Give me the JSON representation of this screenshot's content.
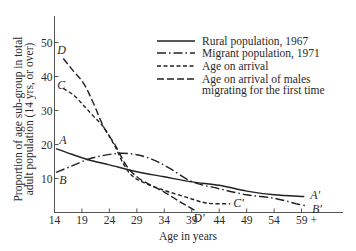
{
  "chart_data": {
    "type": "line",
    "title": "",
    "xlabel": "Age in years",
    "ylabel_lines": [
      "Proportion of age sub-group in total",
      "adult population (14 yrs, or over)"
    ],
    "x_ticks": [
      "14",
      "19",
      "24",
      "29",
      "34",
      "39",
      "44",
      "49",
      "54",
      "59 +"
    ],
    "x_tick_values": [
      14,
      19,
      24,
      29,
      34,
      39,
      44,
      49,
      54,
      59
    ],
    "y_ticks": [
      "10",
      "20",
      "30",
      "40",
      "50"
    ],
    "y_tick_values": [
      10,
      20,
      30,
      40,
      50
    ],
    "xlim": [
      14,
      66
    ],
    "ylim": [
      0,
      58
    ],
    "grid": false,
    "legend_position": "upper right",
    "series": [
      {
        "name": "Rural population, 1967",
        "style": "solid",
        "start_label": "A",
        "end_label": "A'",
        "points": [
          [
            14.3,
            18.8
          ],
          [
            17,
            17.2
          ],
          [
            20,
            15.6
          ],
          [
            24,
            14.0
          ],
          [
            29,
            12.0
          ],
          [
            34,
            10.5
          ],
          [
            39,
            9.0
          ],
          [
            44,
            8.0
          ],
          [
            49,
            6.3
          ],
          [
            54,
            5.2
          ],
          [
            59.5,
            4.7
          ]
        ]
      },
      {
        "name": "Migrant population, 1971",
        "style": "dashdot",
        "start_label": "B",
        "end_label": "B'",
        "points": [
          [
            14.3,
            11.8
          ],
          [
            17,
            13.6
          ],
          [
            20,
            15.6
          ],
          [
            23,
            16.8
          ],
          [
            26,
            17.4
          ],
          [
            29,
            17.0
          ],
          [
            32,
            15.5
          ],
          [
            35,
            13.0
          ],
          [
            39,
            9.1
          ],
          [
            44,
            7.0
          ],
          [
            49,
            5.2
          ],
          [
            54,
            4.2
          ],
          [
            58,
            2.6
          ],
          [
            59.8,
            2.0
          ]
        ]
      },
      {
        "name": "Age on arrival",
        "style": "dashed-short",
        "start_label": "C",
        "end_label": "C'",
        "points": [
          [
            15.6,
            36.5
          ],
          [
            17.5,
            34.5
          ],
          [
            19.3,
            31.5
          ],
          [
            21,
            28.5
          ],
          [
            23,
            25.0
          ],
          [
            25,
            19.5
          ],
          [
            26.5,
            14.5
          ],
          [
            28,
            11.0
          ],
          [
            30,
            9.0
          ],
          [
            34,
            6.5
          ],
          [
            38,
            4.5
          ],
          [
            41,
            3.0
          ],
          [
            43,
            2.6
          ],
          [
            46,
            2.6
          ]
        ]
      },
      {
        "name": "Age on arrival of males migrating for the first time",
        "style": "dashed-long",
        "start_label": "D",
        "end_label": "D'",
        "points": [
          [
            15.6,
            45.3
          ],
          [
            17.5,
            41.5
          ],
          [
            19.3,
            38.0
          ],
          [
            21,
            32.5
          ],
          [
            23,
            25.0
          ],
          [
            25,
            20.0
          ],
          [
            27,
            14.0
          ],
          [
            29,
            10.5
          ],
          [
            31,
            8.5
          ],
          [
            34,
            6.0
          ],
          [
            37,
            3.0
          ],
          [
            40,
            0.2
          ]
        ]
      }
    ],
    "legend": [
      {
        "label": "Rural population, 1967",
        "style": "solid"
      },
      {
        "label": "Migrant population, 1971",
        "style": "dashdot"
      },
      {
        "label": "Age on arrival",
        "style": "dashed-short"
      },
      {
        "label": "Age on arrival of males",
        "label_line2": "migrating for the first time",
        "style": "dashed-long"
      }
    ]
  }
}
